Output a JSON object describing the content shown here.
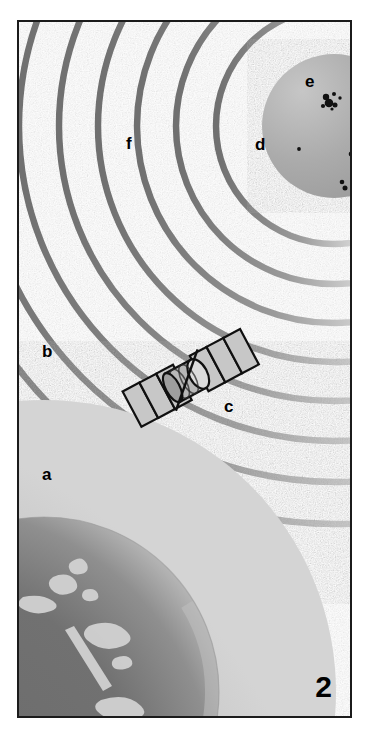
{
  "figure": {
    "panel_number": "2",
    "background_color": "#ffffff",
    "frame_color": "#1b1b1b",
    "width": 371,
    "height": 740
  },
  "labels": [
    {
      "id": "a",
      "text": "a",
      "x": 40,
      "y": 462,
      "describes": "earth-globe"
    },
    {
      "id": "b",
      "text": "b",
      "x": 40,
      "y": 340,
      "describes": "earth-atmosphere-halo"
    },
    {
      "id": "c",
      "text": "c",
      "x": 222,
      "y": 395,
      "describes": "satellite"
    },
    {
      "id": "d",
      "text": "d",
      "x": 253,
      "y": 133,
      "describes": "space-between-sun-and-wavefronts"
    },
    {
      "id": "e",
      "text": "e",
      "x": 303,
      "y": 70,
      "describes": "sunspots"
    },
    {
      "id": "f",
      "text": "f",
      "x": 124,
      "y": 132,
      "describes": "solar-wind-wavefront-arcs"
    }
  ],
  "sun": {
    "name": "sun",
    "center_x": 332,
    "center_y": 124,
    "radius": 72,
    "fill_color": "#a9a9a9",
    "highlight_color": "#c8c8c8",
    "sunspots": [
      {
        "cx": 324,
        "cy": 95,
        "r": 3.2
      },
      {
        "cx": 332,
        "cy": 92,
        "r": 2.0
      },
      {
        "cx": 338,
        "cy": 96,
        "r": 1.6
      },
      {
        "cx": 327,
        "cy": 101,
        "r": 4.2
      },
      {
        "cx": 333,
        "cy": 103,
        "r": 2.4
      },
      {
        "cx": 321,
        "cy": 104,
        "r": 2.0
      },
      {
        "cx": 330,
        "cy": 107,
        "r": 1.5
      },
      {
        "cx": 297,
        "cy": 147,
        "r": 1.8
      },
      {
        "cx": 351,
        "cy": 136,
        "r": 2.4
      },
      {
        "cx": 349,
        "cy": 152,
        "r": 2.2
      },
      {
        "cx": 353,
        "cy": 156,
        "r": 1.6
      },
      {
        "cx": 340,
        "cy": 180,
        "r": 2.2
      },
      {
        "cx": 343,
        "cy": 186,
        "r": 2.4
      }
    ],
    "sunspot_color": "#0d0d0d"
  },
  "wavefronts": {
    "name": "solar-wind-wavefront-arcs",
    "description": "concentric circular arcs radiating outward from the sun",
    "center_x": 332,
    "center_y": 124,
    "stroke_color": "#8f8f8f",
    "stroke_highlight": "#cfcfcf",
    "stroke_width": 6,
    "radii": [
      118,
      158,
      196,
      234,
      272,
      312,
      352,
      392
    ]
  },
  "earth": {
    "name": "earth-globe",
    "center_x": 42,
    "center_y": 690,
    "radius": 175,
    "ocean_color": "#6e6e6e",
    "land_color": "#d2d2d2",
    "limb_color": "#b4b4b4",
    "atmosphere": {
      "name": "earth-atmosphere-halo",
      "radius": 292,
      "color": "#cccccc",
      "inner_color": "#bdbdbd"
    }
  },
  "satellite": {
    "name": "satellite",
    "center_x": 183,
    "center_y": 379,
    "rotation_deg": -28,
    "body_color": "#c4c4c4",
    "panel_color": "#c9c9c9",
    "outline_color": "#111111",
    "panel_segments": 3
  }
}
